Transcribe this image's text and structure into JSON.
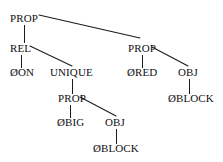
{
  "figure": {
    "kind": "syntax-parse-tree",
    "background_color": "#ffffff",
    "line_color": "#1a1a1a",
    "text_color": "#111111"
  },
  "nodes": [
    {
      "id": "prop_root",
      "label": "PROP",
      "x": 10,
      "y": 22,
      "anchor": "start"
    },
    {
      "id": "rel",
      "label": "REL",
      "x": 10,
      "y": 52,
      "anchor": "start"
    },
    {
      "id": "on_leaf",
      "label": "ØON",
      "x": 10,
      "y": 76,
      "anchor": "start"
    },
    {
      "id": "unique",
      "label": "UNIQUE",
      "x": 50,
      "y": 76,
      "anchor": "start"
    },
    {
      "id": "prop_mid",
      "label": "PROP",
      "x": 58,
      "y": 102,
      "anchor": "start"
    },
    {
      "id": "big_leaf",
      "label": "ØBIG",
      "x": 57,
      "y": 126,
      "anchor": "start"
    },
    {
      "id": "obj_mid",
      "label": "OBJ",
      "x": 105,
      "y": 126,
      "anchor": "start"
    },
    {
      "id": "block_bottom",
      "label": "ØBLOCK",
      "x": 93,
      "y": 152,
      "anchor": "start"
    },
    {
      "id": "prop_right",
      "label": "PROP",
      "x": 128,
      "y": 52,
      "anchor": "start"
    },
    {
      "id": "red_leaf",
      "label": "ØRED",
      "x": 127,
      "y": 76,
      "anchor": "start"
    },
    {
      "id": "obj_right",
      "label": "OBJ",
      "x": 178,
      "y": 76,
      "anchor": "start"
    },
    {
      "id": "block_right",
      "label": "ØBLOCK",
      "x": 168,
      "y": 102,
      "anchor": "start"
    }
  ],
  "edges": [
    {
      "id": "prop_root-rel",
      "from": "prop_root",
      "to": "rel",
      "x1": 24,
      "y1": 25,
      "x2": 24,
      "y2": 42,
      "style": "vertical"
    },
    {
      "id": "prop_root-prop_right",
      "from": "prop_root",
      "to": "prop_right",
      "x1": 39,
      "y1": 15,
      "x2": 140,
      "y2": 38,
      "style": "diagonal"
    },
    {
      "id": "rel-on_leaf",
      "from": "rel",
      "to": "on_leaf",
      "x1": 21,
      "y1": 55,
      "x2": 21,
      "y2": 67,
      "style": "vertical"
    },
    {
      "id": "rel-unique",
      "from": "rel",
      "to": "unique",
      "x1": 30,
      "y1": 46,
      "x2": 72,
      "y2": 66,
      "style": "diagonal"
    },
    {
      "id": "unique-prop_mid",
      "from": "unique",
      "to": "prop_mid",
      "x1": 72,
      "y1": 79,
      "x2": 72,
      "y2": 93,
      "style": "vertical"
    },
    {
      "id": "prop_mid-big_leaf",
      "from": "prop_mid",
      "to": "big_leaf",
      "x1": 70,
      "y1": 105,
      "x2": 70,
      "y2": 117,
      "style": "vertical"
    },
    {
      "id": "prop_mid-obj_mid",
      "from": "prop_mid",
      "to": "obj_mid",
      "x1": 80,
      "y1": 97,
      "x2": 116,
      "y2": 116,
      "style": "diagonal"
    },
    {
      "id": "obj_mid-block_bottom",
      "from": "obj_mid",
      "to": "block_bottom",
      "x1": 116,
      "y1": 129,
      "x2": 116,
      "y2": 143,
      "style": "vertical"
    },
    {
      "id": "prop_right-red_leaf",
      "from": "prop_right",
      "to": "red_leaf",
      "x1": 142,
      "y1": 55,
      "x2": 142,
      "y2": 67,
      "style": "vertical"
    },
    {
      "id": "prop_right-obj_right",
      "from": "prop_right",
      "to": "obj_right",
      "x1": 152,
      "y1": 47,
      "x2": 188,
      "y2": 66,
      "style": "diagonal"
    },
    {
      "id": "obj_right-block_right",
      "from": "obj_right",
      "to": "block_right",
      "x1": 189,
      "y1": 79,
      "x2": 189,
      "y2": 93,
      "style": "vertical"
    }
  ]
}
